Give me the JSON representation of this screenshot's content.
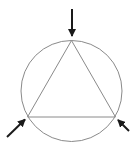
{
  "diagram": {
    "type": "inscribed-triangle-with-forces",
    "circle": {
      "cx": 71.5,
      "cy": 91,
      "r": 50.5,
      "stroke": "#8a8a8a"
    },
    "triangle": {
      "points": [
        [
          71.5,
          40.5
        ],
        [
          27.5,
          117
        ],
        [
          115.5,
          117
        ]
      ],
      "stroke": "#8a8a8a"
    },
    "arrows": [
      {
        "name": "top-force-arrow",
        "from": [
          72,
          9
        ],
        "to": [
          72,
          36
        ]
      },
      {
        "name": "bottom-left-force-arrow",
        "from": [
          7,
          137
        ],
        "to": [
          25,
          119.5
        ]
      },
      {
        "name": "bottom-right-force-arrow",
        "from": [
          129,
          131
        ],
        "to": [
          118,
          120
        ]
      }
    ],
    "arrow_color": "#1a1a1a"
  }
}
